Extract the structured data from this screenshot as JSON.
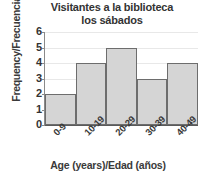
{
  "chart_data": {
    "type": "bar",
    "title": "Visitantes a la biblioteca los sábados",
    "title_lines": [
      "Visitantes a la biblioteca",
      "los sábados"
    ],
    "categories": [
      "0-9",
      "10-19",
      "20-29",
      "30-39",
      "40-49"
    ],
    "values": [
      2,
      4,
      5,
      3,
      4
    ],
    "xlabel": "Age (years)/Edad (años)",
    "ylabel": "Frequency/Frecuencia",
    "ylim": [
      0,
      6
    ],
    "ytick_labels": [
      "0",
      "1",
      "2",
      "3",
      "4",
      "5",
      "6"
    ],
    "ytick_values": [
      0,
      1,
      2,
      3,
      4,
      5,
      6
    ],
    "grid": true,
    "legend": false,
    "colors": {
      "bar_fill": "#d5d5d5",
      "bar_border": "#6d6d6d",
      "gridline": "#e8e8e8",
      "axis": "#5a5a5a",
      "text": "#333333",
      "background": "#ffffff"
    }
  }
}
